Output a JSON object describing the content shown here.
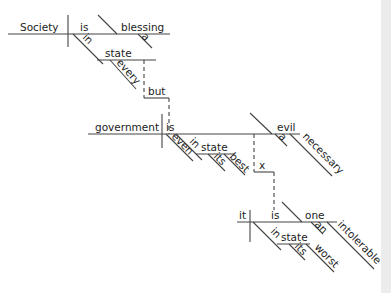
{
  "diagram": {
    "type": "reed-kellogg sentence diagram",
    "sentence": "Society in every state is a blessing, but government even in its best state is a necessary evil; in its worst state an intolerable one.",
    "colors": {
      "ink": "#444444",
      "text": "#222222",
      "background": "#ffffff",
      "right_strip": "#ececec"
    },
    "clause1": {
      "subject": "Society",
      "verb": "is",
      "complement": "blessing",
      "complement_modifier": "a",
      "prep": "in",
      "prep_object": "state",
      "prep_object_modifier": "every"
    },
    "conjunction": "but",
    "clause2": {
      "subject": "government",
      "verb": "is",
      "complement": "evil",
      "complement_modifiers": [
        "a",
        "necessary"
      ],
      "adverb": "even",
      "prep": "in",
      "prep_object": "state",
      "prep_object_modifiers": [
        "its",
        "best"
      ]
    },
    "ellipsis_marker": "x",
    "clause3": {
      "subject": "it",
      "verb": "is",
      "complement": "one",
      "complement_modifiers": [
        "an",
        "intolerable"
      ],
      "prep": "in",
      "prep_object": "state",
      "prep_object_modifiers": [
        "its",
        "worst"
      ]
    }
  }
}
